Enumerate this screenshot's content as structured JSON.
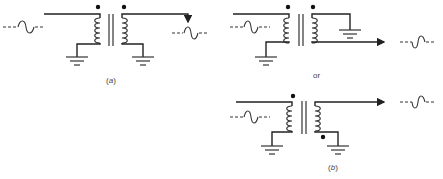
{
  "diagrams": {
    "a": {
      "label_open": "(",
      "label_letter": "a",
      "label_close": ")"
    },
    "b": {
      "label_open": "(",
      "label_letter": "b",
      "label_close": ")"
    },
    "separator": "or"
  }
}
